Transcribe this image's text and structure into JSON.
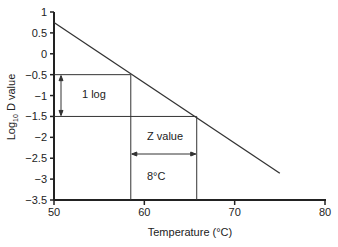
{
  "chart_data": {
    "type": "line",
    "title": "",
    "xlabel": "Temperature (°C)",
    "ylabel_main": "Log",
    "ylabel_sub": "10",
    "ylabel_rest": " D value",
    "xlim": [
      50,
      80
    ],
    "ylim": [
      -3.5,
      1
    ],
    "x_ticks": [
      50,
      60,
      70,
      80
    ],
    "y_ticks": [
      1,
      0.5,
      0,
      -0.5,
      -1,
      -1.5,
      -2,
      -2.5,
      -3,
      -3.5
    ],
    "y_tick_labels": [
      "1",
      "0.5",
      "0",
      "−0.5",
      "−1",
      "−1.5",
      "−2",
      "−2.5",
      "−3",
      "−3.5"
    ],
    "grid": false,
    "series": [
      {
        "name": "Log10 D value",
        "x": [
          50,
          75
        ],
        "y": [
          0.75,
          -2.86
        ]
      }
    ],
    "annotations": {
      "d_lines": [
        -0.5,
        -1.5
      ],
      "z_lines": [
        58.5,
        65.8
      ],
      "one_log_label": "1 log",
      "z_value_label": "Z value",
      "z_degrees_label": "8°C"
    }
  }
}
